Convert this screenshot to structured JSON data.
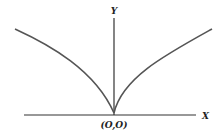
{
  "diagram": {
    "type": "cusp-curve",
    "axes": {
      "x_label": "X",
      "y_label": "Y",
      "origin_label": "(O,O)"
    },
    "colors": {
      "axis": "#333333",
      "curve": "#555555",
      "text": "#222222"
    }
  }
}
